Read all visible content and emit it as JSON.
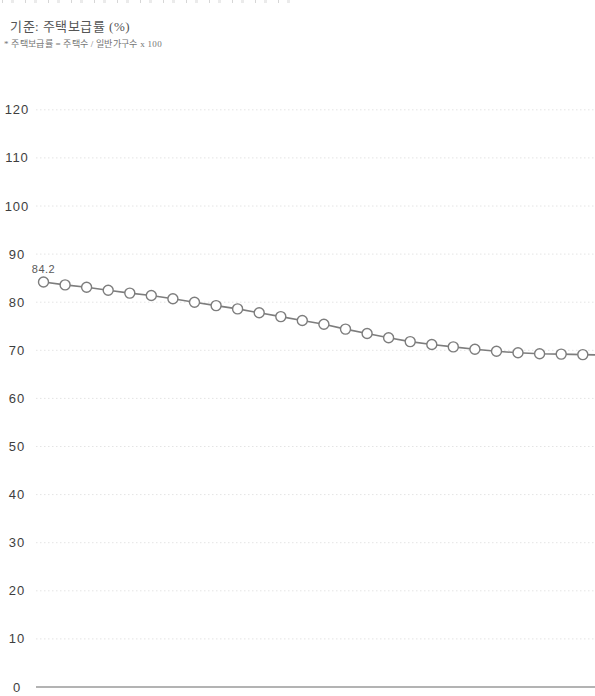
{
  "page": {
    "background": "#ffffff"
  },
  "header": {
    "criteria_label": "기준: 주택보급률 (%)",
    "footnote": "* 주택보급률 = 주택수 / 일반가구수 x 100"
  },
  "chart_data": {
    "type": "line",
    "title": "기준: 주택보급률 (%)",
    "ylabel": "주택보급률 (%)",
    "ylim": [
      0,
      120
    ],
    "y_ticks": [
      120,
      110,
      100,
      90,
      80,
      70,
      60,
      50,
      40,
      30,
      20,
      10,
      0
    ],
    "grid": true,
    "legend": false,
    "x_tick_labels_visible": false,
    "series": [
      {
        "name": "주택보급률",
        "values": [
          84.2,
          83.6,
          83.1,
          82.5,
          81.9,
          81.4,
          80.7,
          80.0,
          79.3,
          78.6,
          77.8,
          77.0,
          76.2,
          75.4,
          74.4,
          73.5,
          72.6,
          71.8,
          71.2,
          70.7,
          70.2,
          69.8,
          69.5,
          69.3,
          69.2,
          69.1
        ]
      }
    ],
    "first_point_label": "84.2",
    "marker": "open-circle",
    "continues_past_right_edge": true,
    "style": {
      "line_color": "#7d7d7d",
      "marker_fill": "#ffffff",
      "grid_color": "#e4e4e4",
      "axis_color": "#9a9a9a",
      "tick_label_color": "#3e3e3e",
      "point_label_color": "#5a5a5a"
    }
  }
}
